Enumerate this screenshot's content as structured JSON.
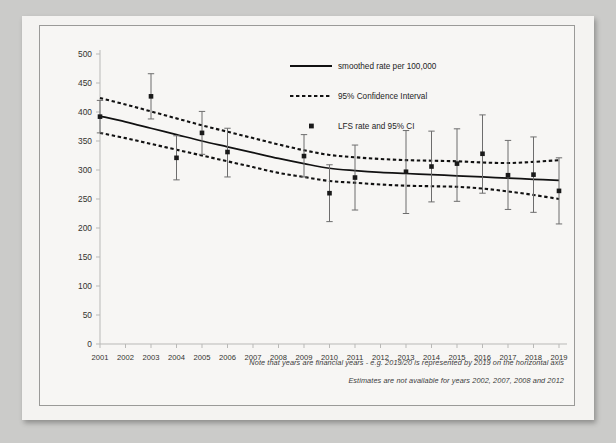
{
  "figure": {
    "notes": [
      "Note that years are financial years - e.g. 2019/20 is represented by 2019 on the horizontal axis",
      "Estimates are not available for years 2002, 2007, 2008 and 2012"
    ]
  },
  "legend": {
    "items": [
      {
        "key": "smoothed",
        "label": "smoothed rate per 100,000",
        "marker": "solid-line"
      },
      {
        "key": "ci_band",
        "label": "95% Confidence Interval",
        "marker": "dashed-line"
      },
      {
        "key": "lfs_point",
        "label": "LFS rate and 95% CI",
        "marker": "point-marker"
      }
    ]
  },
  "colors": {
    "line": "#111111",
    "dashed": "#111111",
    "marker": "#1a1a1a",
    "errorbar": "#6d6d6d",
    "axis": "#b9b9b7",
    "tick_text": "#33332f",
    "paper": "#f4f3f1"
  },
  "chart_data": {
    "type": "line",
    "title": "",
    "xlabel": "",
    "ylabel": "",
    "xlim": [
      2001,
      2019
    ],
    "ylim": [
      0,
      500
    ],
    "ytick_step": 50,
    "grid": false,
    "legend_position": "top-right",
    "categories": [
      "2001",
      "2002",
      "2003",
      "2004",
      "2005",
      "2006",
      "2007",
      "2008",
      "2009",
      "2010",
      "2011",
      "2012",
      "2013",
      "2014",
      "2015",
      "2016",
      "2017",
      "2018",
      "2019"
    ],
    "yticks": [
      0,
      50,
      100,
      150,
      200,
      250,
      300,
      350,
      400,
      450,
      500
    ],
    "series": [
      {
        "name": "smoothed rate per 100,000",
        "style": "solid",
        "x": [
          2001,
          2002,
          2003,
          2004,
          2005,
          2006,
          2007,
          2008,
          2009,
          2010,
          2011,
          2012,
          2013,
          2014,
          2015,
          2016,
          2017,
          2018,
          2019
        ],
        "values": [
          393,
          383,
          372,
          361,
          350,
          340,
          330,
          320,
          311,
          303,
          299,
          296,
          294,
          292,
          290,
          288,
          286,
          284,
          282
        ]
      },
      {
        "name": "95% Confidence Interval upper",
        "style": "dashed",
        "x": [
          2001,
          2002,
          2003,
          2004,
          2005,
          2006,
          2007,
          2008,
          2009,
          2010,
          2011,
          2012,
          2013,
          2014,
          2015,
          2016,
          2017,
          2018,
          2019
        ],
        "values": [
          424,
          413,
          401,
          389,
          377,
          366,
          355,
          344,
          334,
          326,
          322,
          319,
          317,
          316,
          315,
          313,
          312,
          314,
          317
        ]
      },
      {
        "name": "95% Confidence Interval lower",
        "style": "dashed",
        "x": [
          2001,
          2002,
          2003,
          2004,
          2005,
          2006,
          2007,
          2008,
          2009,
          2010,
          2011,
          2012,
          2013,
          2014,
          2015,
          2016,
          2017,
          2018,
          2019
        ],
        "values": [
          364,
          355,
          345,
          335,
          325,
          315,
          305,
          295,
          288,
          281,
          278,
          275,
          273,
          272,
          271,
          268,
          263,
          257,
          250
        ]
      }
    ],
    "points": [
      {
        "x": 2001,
        "y": 392,
        "ci_low": 364,
        "ci_high": 420
      },
      {
        "x": 2003,
        "y": 427,
        "ci_low": 388,
        "ci_high": 466
      },
      {
        "x": 2004,
        "y": 321,
        "ci_low": 283,
        "ci_high": 359
      },
      {
        "x": 2005,
        "y": 364,
        "ci_low": 327,
        "ci_high": 401
      },
      {
        "x": 2006,
        "y": 331,
        "ci_low": 288,
        "ci_high": 372
      },
      {
        "x": 2009,
        "y": 324,
        "ci_low": 288,
        "ci_high": 361
      },
      {
        "x": 2010,
        "y": 260,
        "ci_low": 211,
        "ci_high": 309
      },
      {
        "x": 2011,
        "y": 287,
        "ci_low": 231,
        "ci_high": 343
      },
      {
        "x": 2013,
        "y": 297,
        "ci_low": 225,
        "ci_high": 368
      },
      {
        "x": 2014,
        "y": 306,
        "ci_low": 245,
        "ci_high": 367
      },
      {
        "x": 2015,
        "y": 311,
        "ci_low": 246,
        "ci_high": 371
      },
      {
        "x": 2016,
        "y": 328,
        "ci_low": 260,
        "ci_high": 395
      },
      {
        "x": 2017,
        "y": 291,
        "ci_low": 232,
        "ci_high": 351
      },
      {
        "x": 2018,
        "y": 292,
        "ci_low": 227,
        "ci_high": 357
      },
      {
        "x": 2019,
        "y": 264,
        "ci_low": 207,
        "ci_high": 321
      }
    ],
    "missing_years": [
      2002,
      2007,
      2008,
      2012
    ]
  }
}
